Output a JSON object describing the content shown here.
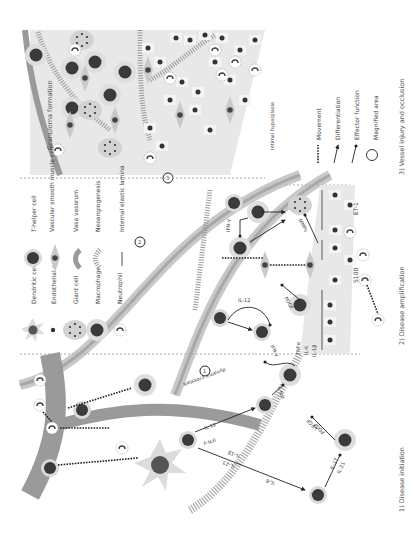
{
  "figure": {
    "orientation": "rotated 90 degrees counter-clockwise",
    "panels": [
      {
        "id": "1",
        "title": "1) Disease initiation"
      },
      {
        "id": "2",
        "title": "2) Disease amplification"
      },
      {
        "id": "3",
        "title": "3) Vessel injury and occlusion"
      }
    ],
    "panel_labels": {
      "granuloma": "Granuloma formation",
      "intimal_hyperplasia": "Intimal hyperplasia",
      "dynamic_crosstalk": "dynamic crosstalk"
    },
    "magnified_markers": [
      "1",
      "2",
      "3"
    ],
    "cytokines": {
      "init_a": "IL-12",
      "init_b": "IFN-γ",
      "init_c": "IL-1β",
      "init_d": "IL-23",
      "init_e": "IL-6",
      "init_f": "IL-17",
      "init_g": "IL-21",
      "init_h": "VEGF",
      "init_i": "PDGF",
      "init_j": "IFN-γ",
      "init_k": "TNFα",
      "init_l": "IL-6",
      "init_m": "IL-1β",
      "amp_a": "IL-12",
      "amp_b": "IFN-γ",
      "amp_c": "PDGF",
      "amp_d": "MMPs",
      "amp_e": "IFN-γ",
      "amp_f": "ET-1",
      "amp_g": "S100"
    },
    "cell_labels": {
      "th": "Th",
      "th1": "Th1",
      "th17": "Th17",
      "m": "M"
    }
  },
  "legend": {
    "cells": [
      {
        "icon": "dendritic-cell-icon",
        "label": "Dendritic cell"
      },
      {
        "icon": "endothelial-cell-icon",
        "label": "Endothelial cell"
      },
      {
        "icon": "giant-cell-icon",
        "label": "Giant cell"
      },
      {
        "icon": "macrophage-icon",
        "label": "Macrophage"
      },
      {
        "icon": "neutrophil-icon",
        "label": "Neutrophil"
      },
      {
        "icon": "t-helper-cell-icon",
        "label": "T-helper cell"
      },
      {
        "icon": "vsmc-icon",
        "label": "Vascular smooth muscle cell"
      },
      {
        "icon": "vasa-vasorum-icon",
        "label": "Vasa vasorum"
      },
      {
        "icon": "neoangiogenesis-icon",
        "label": "Neoangiogenesis"
      },
      {
        "icon": "internal-elastic-lamina-icon",
        "label": "Internal elastic lamina"
      }
    ],
    "arrows": [
      {
        "icon": "movement-icon",
        "label": "Movement"
      },
      {
        "icon": "differentiation-icon",
        "label": "Differentiation"
      },
      {
        "icon": "effector-function-icon",
        "label": "Effector function"
      },
      {
        "icon": "magnified-area-icon",
        "label": "Magnified area"
      }
    ]
  },
  "colors": {
    "vessel": "#9a9a9a",
    "vessel_light": "#c8c8c8",
    "tissue": "#e6e6e6",
    "cell_dark": "#3a3a3a",
    "cell_halo": "#d7d7d7",
    "background": "#ffffff"
  }
}
